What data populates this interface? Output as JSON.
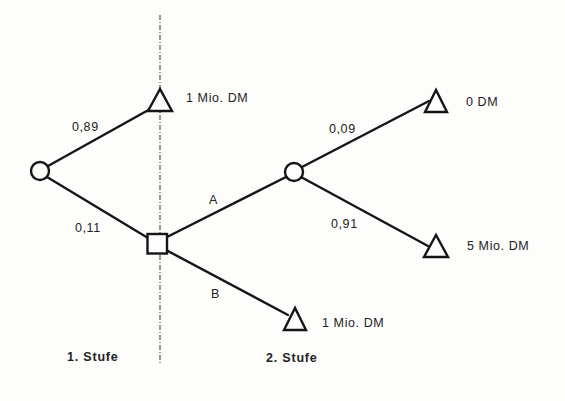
{
  "diagram": {
    "type": "decision-tree",
    "stages": [
      {
        "label": "1. Stufe"
      },
      {
        "label": "2. Stufe"
      }
    ],
    "nodes": {
      "chance_root": {
        "kind": "chance"
      },
      "decision": {
        "kind": "decision"
      },
      "chance_a": {
        "kind": "chance"
      },
      "terminal_top": {
        "kind": "terminal",
        "label": "1 Mio. DM"
      },
      "terminal_a_up": {
        "kind": "terminal",
        "label": "0 DM"
      },
      "terminal_a_down": {
        "kind": "terminal",
        "label": "5 Mio. DM"
      },
      "terminal_b": {
        "kind": "terminal",
        "label": "1 Mio. DM"
      }
    },
    "edges": {
      "root_to_top": {
        "label": "0,89"
      },
      "root_to_decision": {
        "label": "0,11"
      },
      "decision_to_a": {
        "label": "A"
      },
      "decision_to_b": {
        "label": "B"
      },
      "a_to_up": {
        "label": "0,09"
      },
      "a_to_down": {
        "label": "0,91"
      }
    }
  }
}
